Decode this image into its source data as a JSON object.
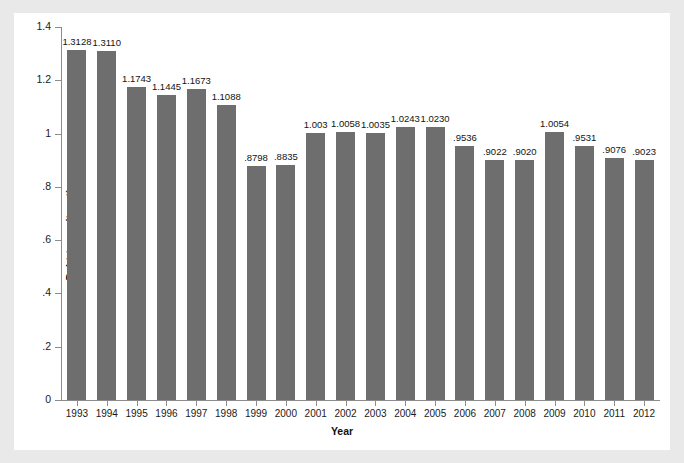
{
  "page": {
    "background_color": "#e9e9e9",
    "card_background_color": "#ffffff",
    "top_caption_fragment": "Figure: Debt-to-equity ratio by year"
  },
  "chart_data": {
    "type": "bar",
    "title": "",
    "xlabel": "Year",
    "ylabel": "Debt-to-equity ratio",
    "categories": [
      "1993",
      "1994",
      "1995",
      "1996",
      "1997",
      "1998",
      "1999",
      "2000",
      "2001",
      "2002",
      "2003",
      "2004",
      "2005",
      "2006",
      "2007",
      "2008",
      "2009",
      "2010",
      "2011",
      "2012"
    ],
    "values": [
      1.3128,
      1.311,
      1.1743,
      1.1445,
      1.1673,
      1.1088,
      0.8798,
      0.8835,
      1.003,
      1.0058,
      1.0035,
      1.0243,
      1.023,
      0.9536,
      0.9022,
      0.902,
      1.0054,
      0.9531,
      0.9076,
      0.9023
    ],
    "value_labels": [
      "1.3128",
      "1.3110",
      "1.1743",
      "1.1445",
      "1.1673",
      "1.1088",
      ".8798",
      ".8835",
      "1.003",
      "1.0058",
      "1.0035",
      "1.0243",
      "1.0230",
      ".9536",
      ".9022",
      ".9020",
      "1.0054",
      ".9531",
      ".9076",
      ".9023"
    ],
    "ylim": [
      0,
      1.4
    ],
    "yticks": [
      0,
      0.2,
      0.4,
      0.6,
      0.8,
      1.0,
      1.2,
      1.4
    ],
    "ytick_labels": [
      "0",
      ".2",
      ".4",
      ".6",
      ".8",
      "1",
      "1.2",
      "1.4"
    ],
    "grid": false,
    "legend": false,
    "bar_color": "#6e6e6e",
    "axis_color": "#8c8c8c",
    "series": [
      {
        "name": "Debt-to-equity ratio",
        "values": [
          1.3128,
          1.311,
          1.1743,
          1.1445,
          1.1673,
          1.1088,
          0.8798,
          0.8835,
          1.003,
          1.0058,
          1.0035,
          1.0243,
          1.023,
          0.9536,
          0.9022,
          0.902,
          1.0054,
          0.9531,
          0.9076,
          0.9023
        ]
      }
    ]
  }
}
